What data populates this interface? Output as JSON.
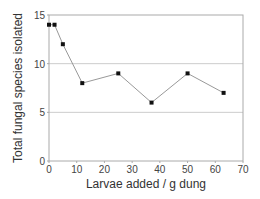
{
  "chart_data": {
    "type": "line",
    "title": "",
    "xlabel": "Larvae added / g dung",
    "ylabel": "Total fungal species isolated",
    "x": [
      0,
      2,
      5,
      12,
      25,
      37,
      50,
      63
    ],
    "series": [
      {
        "name": "Total fungal species",
        "values": [
          14,
          14,
          12,
          8,
          9,
          6,
          9,
          7
        ]
      }
    ],
    "xlim": [
      0,
      70
    ],
    "ylim": [
      0,
      15
    ],
    "xticks": [
      0,
      10,
      20,
      30,
      40,
      50,
      60,
      70
    ],
    "yticks": [
      0,
      5,
      10,
      15
    ],
    "grid": "horizontal at 5 and 10",
    "legend": "none",
    "colors": {
      "line": "#999999",
      "marker": "#111111",
      "grid": "#cccccc",
      "frame": "#aaaaaa"
    }
  },
  "labels": {
    "xlabel": "Larvae added / g dung",
    "ylabel": "Total fungal species isolated",
    "xticks": [
      "0",
      "10",
      "20",
      "30",
      "40",
      "50",
      "60",
      "70"
    ],
    "yticks": [
      "0",
      "5",
      "10",
      "15"
    ]
  }
}
